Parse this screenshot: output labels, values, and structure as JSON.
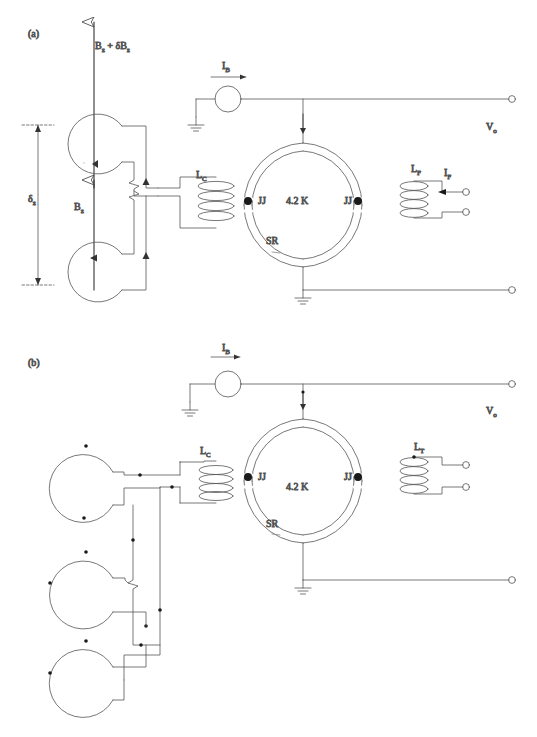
{
  "figure": {
    "type": "circuit-diagram",
    "stroke_color": "#555555",
    "text_color": "#333333",
    "background": "#ffffff"
  },
  "panels": [
    {
      "tag": "(a)",
      "name": "first-order-axial-gradiometer",
      "pickup_loops": 2,
      "labels": {
        "field_top": "B",
        "field_top_sub": "z",
        "field_top_extra": " + δB",
        "field_top_extra_sub": "z",
        "field_top_full": "B₂ + δB₂",
        "field_bottom": "B",
        "field_bottom_sub": "z",
        "baseline": "δ",
        "baseline_sub": "z",
        "bias_current": "I",
        "bias_current_sub": "B",
        "coupling_coil": "L",
        "coupling_coil_sub": "C",
        "feedback_coil": "L",
        "feedback_coil_sub": "F",
        "feedback_current": "I",
        "feedback_current_sub": "F",
        "junction_left": "JJ",
        "junction_right": "JJ",
        "temperature": "4.2 K",
        "ring": "SR",
        "output_voltage": "V",
        "output_voltage_sub": "o"
      }
    },
    {
      "tag": "(b)",
      "name": "second-order-gradiometer",
      "pickup_loops": 3,
      "labels": {
        "bias_current": "I",
        "bias_current_sub": "B",
        "coupling_coil": "L",
        "coupling_coil_sub": "C",
        "transformer_coil": "L",
        "transformer_coil_sub": "T",
        "junction_left": "JJ",
        "junction_right": "JJ",
        "temperature": "4.2 K",
        "ring": "SR",
        "output_voltage": "V",
        "output_voltage_sub": "o"
      }
    }
  ],
  "legend_text": {
    "JJ": "Josephson junction",
    "SR": "superconducting ring",
    "LC": "coupling inductance",
    "LF": "feedback inductance",
    "LT": "transformer inductance",
    "IB": "bias current",
    "IF": "feedback current",
    "Vo": "output voltage",
    "temperature": "4.2 K"
  }
}
